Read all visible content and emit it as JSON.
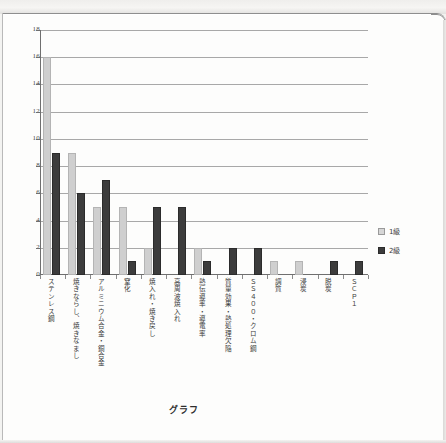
{
  "caption": "グラフ",
  "legend": {
    "position": "right",
    "entries": [
      {
        "label": "1級",
        "color": "#d6d6d6"
      },
      {
        "label": "2級",
        "color": "#3c3c3c"
      }
    ]
  },
  "axis": {
    "y_ticks": [
      "18",
      "16",
      "14",
      "12",
      "10",
      "8",
      "6",
      "4",
      "2",
      "0"
    ]
  },
  "chart_data": {
    "type": "bar",
    "title": "グラフ",
    "xlabel": "",
    "ylabel": "",
    "ylim": [
      0,
      18
    ],
    "ytick_step": 2,
    "grid": true,
    "legend_position": "right",
    "categories": [
      "ステンレス鋼",
      "焼きならし、焼きなまし",
      "アルミニウム合金・銅合金",
      "窒化",
      "焼入れ・焼き戻し",
      "高周波焼入れ",
      "熱伝導率・導電率",
      "質量効果・熱処理欠陥",
      "ＳＳ４００・クロム鋼",
      "調質",
      "浸炭",
      "脱炭",
      "ＳＣＰ１"
    ],
    "series": [
      {
        "name": "1級",
        "color": "#d6d6d6",
        "values": [
          16,
          9,
          5,
          5,
          2,
          0,
          2,
          0,
          0,
          1,
          1,
          0,
          0
        ]
      },
      {
        "name": "2級",
        "color": "#3c3c3c",
        "values": [
          9,
          6,
          7,
          1,
          5,
          5,
          1,
          2,
          2,
          0,
          0,
          1,
          1
        ]
      }
    ]
  }
}
